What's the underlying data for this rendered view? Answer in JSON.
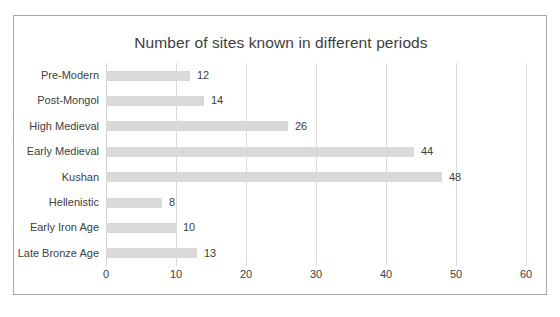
{
  "chart_data": {
    "type": "bar",
    "orientation": "horizontal",
    "title": "Number of sites known in different periods",
    "xlabel": "",
    "ylabel": "",
    "categories": [
      "Pre-Modern",
      "Post-Mongol",
      "High Medieval",
      "Early Medieval",
      "Kushan",
      "Hellenistic",
      "Early Iron Age",
      "Late Bronze Age"
    ],
    "values": [
      12,
      14,
      26,
      44,
      48,
      8,
      10,
      13
    ],
    "data_labels": [
      "12",
      "14",
      "26",
      "44",
      "48",
      "8",
      "10",
      "13"
    ],
    "xlim": [
      0,
      60
    ],
    "xticks": [
      0,
      10,
      20,
      30,
      40,
      50,
      60
    ],
    "xtick_labels": [
      "0",
      "10",
      "20",
      "30",
      "40",
      "50",
      "60"
    ],
    "grid": {
      "vertical": true,
      "horizontal": false
    },
    "legend": {
      "visible": false,
      "position": "none"
    },
    "colors": {
      "bar_fill": "#d9d9d9",
      "gridline": "#d9d9d9",
      "text": "#404040",
      "border": "#a6a6a6",
      "background": "#ffffff"
    }
  }
}
